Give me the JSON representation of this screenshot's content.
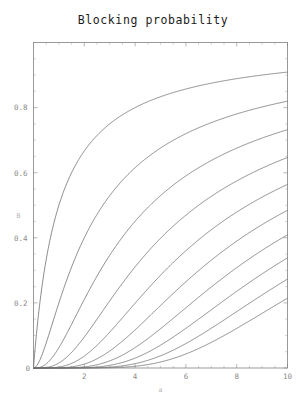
{
  "chart_data": {
    "type": "line",
    "title": "Blocking probability",
    "xlabel": "a",
    "ylabel": "B",
    "xlim": [
      0,
      10
    ],
    "ylim": [
      0,
      1
    ],
    "grid": false,
    "legend": "none",
    "frame": "box",
    "x_ticks_major": [
      2,
      4,
      6,
      8,
      10
    ],
    "x_tick_labels": [
      "2",
      "4",
      "6",
      "8",
      "10"
    ],
    "y_ticks_major": [
      0,
      0.2,
      0.4,
      0.6,
      0.8
    ],
    "y_tick_labels": [
      "0",
      "0.2",
      "0.4",
      "0.6",
      "0.8"
    ],
    "x_minor_step": 0.5,
    "y_minor_step": 0.05,
    "x_label_at_origin": "0",
    "model": "erlang-b",
    "x_name": "offered traffic (Erlangs)",
    "y_name": "blocking probability",
    "series": [
      {
        "name": "N = 1",
        "servers": 1,
        "value_at_x10": 0.909
      },
      {
        "name": "N = 2",
        "servers": 2,
        "value_at_x10": 0.819
      },
      {
        "name": "N = 3",
        "servers": 3,
        "value_at_x10": 0.732
      },
      {
        "name": "N = 4",
        "servers": 4,
        "value_at_x10": 0.647
      },
      {
        "name": "N = 5",
        "servers": 5,
        "value_at_x10": 0.564
      },
      {
        "name": "N = 6",
        "servers": 6,
        "value_at_x10": 0.484
      },
      {
        "name": "N = 7",
        "servers": 7,
        "value_at_x10": 0.409
      },
      {
        "name": "N = 8",
        "servers": 8,
        "value_at_x10": 0.338
      },
      {
        "name": "N = 9",
        "servers": 9,
        "value_at_x10": 0.273
      },
      {
        "name": "N = 10",
        "servers": 10,
        "value_at_x10": 0.215
      }
    ],
    "x_samples": [
      0,
      0.5,
      1,
      1.5,
      2,
      2.5,
      3,
      3.5,
      4,
      4.5,
      5,
      5.5,
      6,
      6.5,
      7,
      7.5,
      8,
      8.5,
      9,
      9.5,
      10
    ],
    "values_by_series": {
      "N = 1": [
        0,
        0.333,
        0.5,
        0.6,
        0.667,
        0.714,
        0.75,
        0.778,
        0.8,
        0.818,
        0.833,
        0.846,
        0.857,
        0.867,
        0.875,
        0.882,
        0.889,
        0.895,
        0.9,
        0.905,
        0.909
      ],
      "N = 2": [
        0,
        0.077,
        0.2,
        0.31,
        0.4,
        0.472,
        0.529,
        0.576,
        0.615,
        0.647,
        0.676,
        0.7,
        0.72,
        0.739,
        0.754,
        0.769,
        0.781,
        0.792,
        0.802,
        0.811,
        0.819
      ],
      "N = 3": [
        0,
        0.013,
        0.062,
        0.134,
        0.211,
        0.282,
        0.346,
        0.402,
        0.451,
        0.494,
        0.532,
        0.565,
        0.594,
        0.62,
        0.643,
        0.664,
        0.683,
        0.7,
        0.715,
        0.724,
        0.732
      ],
      "N = 4": [
        0,
        0.002,
        0.015,
        0.048,
        0.095,
        0.148,
        0.206,
        0.259,
        0.308,
        0.353,
        0.395,
        0.432,
        0.466,
        0.497,
        0.525,
        0.55,
        0.573,
        0.594,
        0.614,
        0.631,
        0.647
      ],
      "N = 5": [
        0,
        0.0,
        0.003,
        0.014,
        0.037,
        0.07,
        0.11,
        0.154,
        0.199,
        0.243,
        0.285,
        0.325,
        0.362,
        0.396,
        0.428,
        0.457,
        0.484,
        0.509,
        0.532,
        0.549,
        0.564
      ],
      "N = 6": [
        0,
        0.0,
        0.001,
        0.004,
        0.012,
        0.028,
        0.052,
        0.082,
        0.117,
        0.154,
        0.192,
        0.229,
        0.265,
        0.3,
        0.332,
        0.363,
        0.392,
        0.419,
        0.444,
        0.465,
        0.484
      ],
      "N = 7": [
        0,
        0.0,
        0.0,
        0.001,
        0.003,
        0.01,
        0.022,
        0.04,
        0.063,
        0.091,
        0.121,
        0.153,
        0.186,
        0.218,
        0.25,
        0.28,
        0.309,
        0.337,
        0.363,
        0.387,
        0.409
      ],
      "N = 8": [
        0,
        0.0,
        0.0,
        0.0,
        0.001,
        0.003,
        0.008,
        0.017,
        0.03,
        0.049,
        0.072,
        0.098,
        0.125,
        0.154,
        0.183,
        0.212,
        0.241,
        0.269,
        0.295,
        0.32,
        0.338
      ],
      "N = 9": [
        0,
        0.0,
        0.0,
        0.0,
        0.0,
        0.001,
        0.003,
        0.007,
        0.014,
        0.024,
        0.039,
        0.058,
        0.08,
        0.104,
        0.13,
        0.156,
        0.183,
        0.209,
        0.235,
        0.255,
        0.273
      ],
      "N = 10": [
        0,
        0.0,
        0.0,
        0.0,
        0.0,
        0.0,
        0.001,
        0.002,
        0.006,
        0.011,
        0.02,
        0.032,
        0.048,
        0.067,
        0.088,
        0.111,
        0.135,
        0.159,
        0.183,
        0.2,
        0.215
      ]
    }
  }
}
